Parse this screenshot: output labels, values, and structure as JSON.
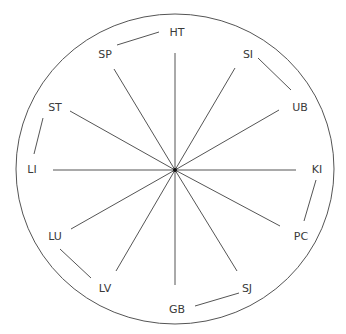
{
  "diagram": {
    "type": "radial-wheel",
    "colors": {
      "line": "#555555",
      "text": "#3a3a3a",
      "background": "#ffffff",
      "hub": "#111111"
    },
    "outline": {
      "cx": 175,
      "cy": 169,
      "rx": 159,
      "ry": 155
    },
    "hub": {
      "x": 175,
      "y": 170,
      "r": 2
    },
    "nodes": [
      {
        "id": "HT",
        "label": "HT",
        "x": 177,
        "y": 33,
        "spoke_end": [
          175,
          53
        ]
      },
      {
        "id": "SI",
        "label": "SI",
        "x": 248,
        "y": 55,
        "spoke_end": [
          235,
          68
        ]
      },
      {
        "id": "UB",
        "label": "UB",
        "x": 300,
        "y": 108,
        "spoke_end": [
          279,
          110
        ]
      },
      {
        "id": "KI",
        "label": "KI",
        "x": 317,
        "y": 170,
        "spoke_end": [
          296,
          170
        ]
      },
      {
        "id": "PC",
        "label": "PC",
        "x": 301,
        "y": 237,
        "spoke_end": [
          280,
          226
        ]
      },
      {
        "id": "SJ",
        "label": "SJ",
        "x": 247,
        "y": 289,
        "spoke_end": [
          237,
          271
        ]
      },
      {
        "id": "GB",
        "label": "GB",
        "x": 177,
        "y": 310,
        "spoke_end": [
          175,
          285
        ]
      },
      {
        "id": "LV",
        "label": "LV",
        "x": 105,
        "y": 289,
        "spoke_end": [
          116,
          271
        ]
      },
      {
        "id": "LU",
        "label": "LU",
        "x": 55,
        "y": 237,
        "spoke_end": [
          71,
          229
        ]
      },
      {
        "id": "LI",
        "label": "LI",
        "x": 32,
        "y": 170,
        "spoke_end": [
          53,
          170
        ]
      },
      {
        "id": "ST",
        "label": "ST",
        "x": 55,
        "y": 108,
        "spoke_end": [
          70,
          111
        ]
      },
      {
        "id": "SP",
        "label": "SP",
        "x": 105,
        "y": 55,
        "spoke_end": [
          114,
          69
        ]
      }
    ],
    "pair_connections": [
      {
        "from": "SP",
        "to": "HT",
        "line": [
          117,
          45,
          159,
          32
        ]
      },
      {
        "from": "SI",
        "to": "UB",
        "line": [
          258,
          58,
          291,
          90
        ]
      },
      {
        "from": "ST",
        "to": "LI",
        "line": [
          43,
          118,
          34,
          154
        ]
      },
      {
        "from": "KI",
        "to": "PC",
        "line": [
          316,
          180,
          304,
          221
        ]
      },
      {
        "from": "LU",
        "to": "LV",
        "line": [
          60,
          249,
          91,
          278
        ]
      },
      {
        "from": "GB",
        "to": "SJ",
        "line": [
          195,
          306,
          239,
          293
        ]
      }
    ]
  }
}
